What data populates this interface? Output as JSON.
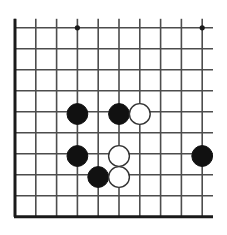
{
  "diagram": {
    "kind": "go-board-diagram",
    "board": {
      "background_color": "#ffffff",
      "line_color": "#4d4d4d",
      "edge_color": "#1a1a1a",
      "line_width": 1.6,
      "edge_line_width": 3.0,
      "cropped_edges": [
        "right",
        "top"
      ],
      "origin_x": 15,
      "origin_y": 27.8,
      "cell_size_x": 20.8,
      "cell_size_y": 21.0,
      "columns": 10,
      "rows": 10,
      "vertical_line_x": [
        15,
        35.8,
        56.6,
        77.4,
        98.2,
        119.0,
        139.8,
        160.6,
        181.4,
        202.2
      ],
      "horizontal_line_y": [
        27.8,
        48.8,
        69.8,
        90.8,
        111.8,
        132.8,
        153.8,
        174.8,
        195.8,
        216.8
      ],
      "vertical_line_top_overhang": 9,
      "horizontal_line_right_extent": 213
    },
    "star_points": {
      "color": "#1a1a1a",
      "radius": 2.6,
      "points": [
        {
          "name": "star-point-top-left",
          "x": 77.4,
          "y": 27.8
        },
        {
          "name": "star-point-top-right",
          "x": 202.2,
          "y": 27.8
        }
      ]
    },
    "stones": {
      "radius": 10.4,
      "black_fill": "#111111",
      "black_stroke": "#111111",
      "white_fill": "#ffffff",
      "white_stroke": "#333333",
      "white_stroke_width": 1.4,
      "list": [
        {
          "name": "stone-black-1",
          "color": "black",
          "x": 77.4,
          "y": 114.0,
          "col": 4,
          "row": 5
        },
        {
          "name": "stone-black-2",
          "color": "black",
          "x": 119.0,
          "y": 114.0,
          "col": 6,
          "row": 5
        },
        {
          "name": "stone-white-1",
          "color": "white",
          "x": 139.8,
          "y": 114.0,
          "col": 7,
          "row": 5
        },
        {
          "name": "stone-black-3",
          "color": "black",
          "x": 77.4,
          "y": 156.0,
          "col": 4,
          "row": 7
        },
        {
          "name": "stone-white-2",
          "color": "white",
          "x": 119.0,
          "y": 156.0,
          "col": 6,
          "row": 7
        },
        {
          "name": "stone-black-4",
          "color": "black",
          "x": 202.2,
          "y": 156.0,
          "col": 10,
          "row": 7
        },
        {
          "name": "stone-black-5",
          "color": "black",
          "x": 98.2,
          "y": 177.0,
          "col": 5,
          "row": 8
        },
        {
          "name": "stone-white-3",
          "color": "white",
          "x": 119.0,
          "y": 177.0,
          "col": 6,
          "row": 8
        }
      ],
      "black_count": 5,
      "white_count": 3
    }
  }
}
